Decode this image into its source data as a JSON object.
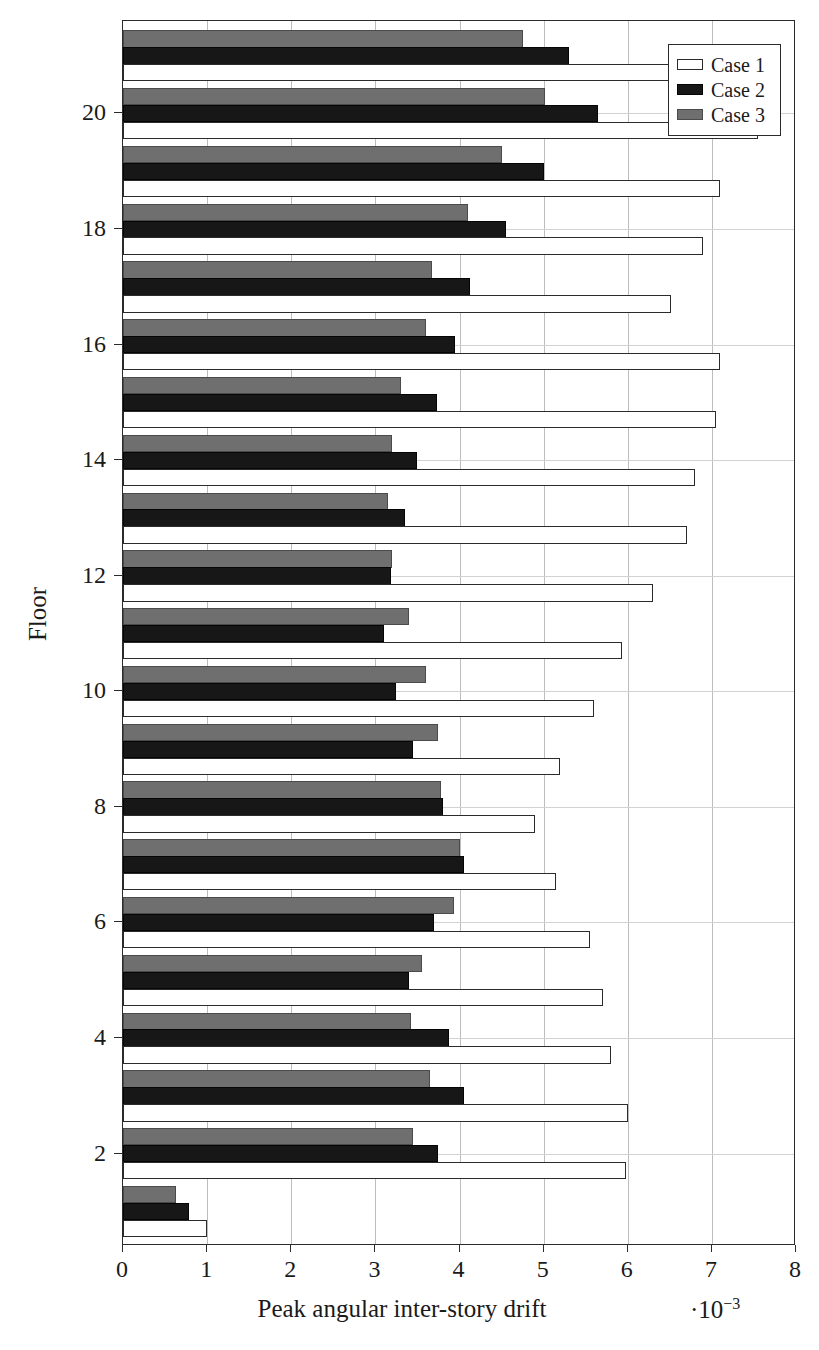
{
  "chart_data": {
    "type": "bar",
    "orientation": "horizontal",
    "title": "",
    "xlabel": "Peak angular inter-story drift",
    "ylabel": "Floor",
    "x_multiplier": "·10",
    "x_multiplier_exp": "−3",
    "xlim": [
      0,
      8
    ],
    "ylim": [
      0.4,
      21.6
    ],
    "xticks": [
      0,
      1,
      2,
      3,
      4,
      5,
      6,
      7,
      8
    ],
    "xtick_labels": [
      "0",
      "1",
      "2",
      "3",
      "4",
      "5",
      "6",
      "7",
      "8"
    ],
    "yticks": [
      2,
      4,
      6,
      8,
      10,
      12,
      14,
      16,
      18,
      20
    ],
    "ytick_labels": [
      "2",
      "4",
      "6",
      "8",
      "10",
      "12",
      "14",
      "16",
      "18",
      "20"
    ],
    "grid": true,
    "legend_position": "top-right",
    "categories": [
      1,
      2,
      3,
      4,
      5,
      6,
      7,
      8,
      9,
      10,
      11,
      12,
      13,
      14,
      15,
      16,
      17,
      18,
      19,
      20,
      21
    ],
    "series": [
      {
        "name": "Case 1",
        "color": "#ffffff",
        "edge_color": "#2b2b2b",
        "values": [
          1.0,
          5.98,
          6.0,
          5.8,
          5.7,
          5.55,
          5.15,
          4.9,
          5.2,
          5.6,
          5.93,
          6.3,
          6.7,
          6.8,
          7.05,
          7.1,
          6.52,
          6.9,
          7.1,
          7.55,
          7.6
        ]
      },
      {
        "name": "Case 2",
        "color": "#171717",
        "edge_color": "#050505",
        "values": [
          0.78,
          3.75,
          4.05,
          3.88,
          3.4,
          3.7,
          4.05,
          3.8,
          3.45,
          3.25,
          3.1,
          3.18,
          3.35,
          3.5,
          3.73,
          3.95,
          4.12,
          4.55,
          5.0,
          5.65,
          5.3
        ]
      },
      {
        "name": "Case 3",
        "color": "#6f6f6f",
        "edge_color": "#4a4a4a",
        "values": [
          0.63,
          3.45,
          3.65,
          3.42,
          3.55,
          3.93,
          4.0,
          3.78,
          3.75,
          3.6,
          3.4,
          3.2,
          3.15,
          3.2,
          3.3,
          3.6,
          3.67,
          4.1,
          4.5,
          5.02,
          4.75
        ]
      }
    ]
  },
  "legend": {
    "items": [
      {
        "label": "Case 1"
      },
      {
        "label": "Case 2"
      },
      {
        "label": "Case 3"
      }
    ]
  }
}
